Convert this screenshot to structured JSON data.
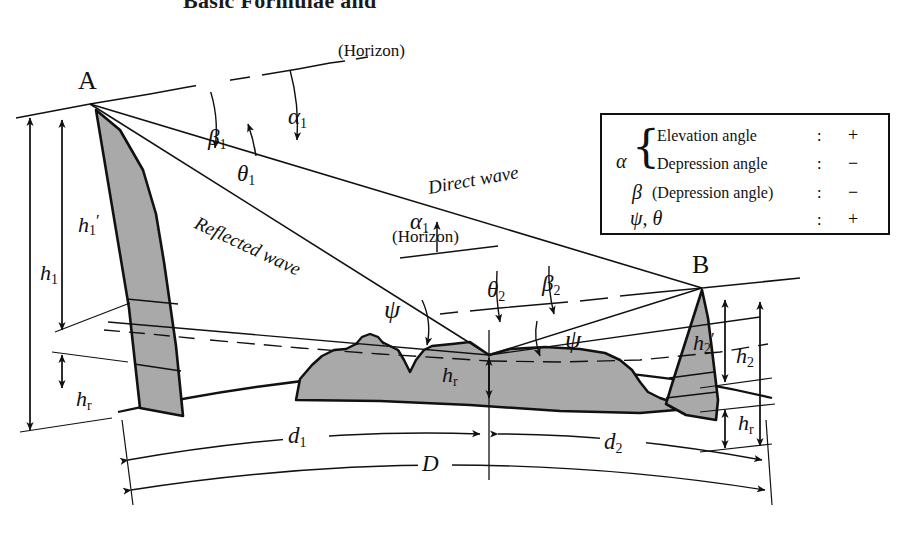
{
  "title": "Basic Formulae and",
  "points": {
    "a_label": "A",
    "b_label": "B"
  },
  "angles": {
    "beta1": "β",
    "beta1_sub": "1",
    "alpha1_top": "α",
    "alpha1_top_sub": "1",
    "theta1": "θ",
    "theta1_sub": "1",
    "alpha1_mid": "α",
    "alpha1_mid_sub": "1",
    "theta2": "θ",
    "theta2_sub": "2",
    "beta2": "β",
    "beta2_sub": "2",
    "psi_left": "ψ",
    "psi_right": "ψ"
  },
  "horizon_labels": {
    "top": "(Horizon)",
    "mid": "(Horizon)"
  },
  "waves": {
    "direct": "Direct wave",
    "reflected": "Reflected wave"
  },
  "heights": {
    "h1_prime": "h",
    "h1_prime_sub": "1",
    "h1_prime_mark": "′",
    "h1": "h",
    "h1_sub": "1",
    "hr_left": "h",
    "hr_left_sub": "r",
    "hr_center": "h",
    "hr_center_sub": "r",
    "hr_right": "h",
    "hr_right_sub": "r",
    "h2_prime": "h",
    "h2_prime_sub": "2",
    "h2_prime_mark": "′",
    "h2": "h",
    "h2_sub": "2"
  },
  "distances": {
    "d1": "d",
    "d1_sub": "1",
    "d2": "d",
    "d2_sub": "2",
    "D": "D"
  },
  "legend": {
    "alpha_symbol": "α",
    "beta_symbol": "β",
    "psi_theta_symbol": "ψ, θ",
    "rows": [
      {
        "text": "Elevation angle",
        "colon": ":",
        "sign": "+"
      },
      {
        "text": "Depression angle",
        "colon": ":",
        "sign": "−"
      },
      {
        "text": "(Depression angle)",
        "colon": ":",
        "sign": "−"
      },
      {
        "text": "",
        "colon": ":",
        "sign": "+"
      }
    ]
  },
  "colors": {
    "terrain_fill": "#a9a9a9",
    "line": "#111111",
    "background": "#ffffff"
  }
}
